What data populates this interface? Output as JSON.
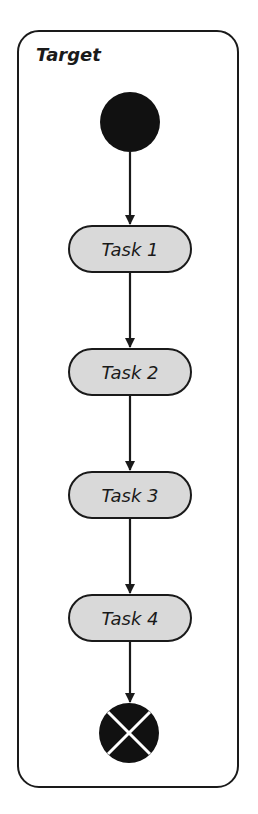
{
  "diagram": {
    "type": "uml-activity",
    "partition_title": "Target",
    "start_node": "initial-node",
    "end_node": "final-node",
    "tasks": [
      {
        "label": "Task 1"
      },
      {
        "label": "Task 2"
      },
      {
        "label": "Task 3"
      },
      {
        "label": "Task 4"
      }
    ],
    "colors": {
      "stroke": "#1a1a1a",
      "task_fill": "#d9d9d9",
      "background": "#ffffff"
    }
  }
}
